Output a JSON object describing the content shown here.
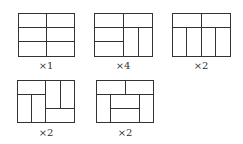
{
  "figures": [
    {
      "id": "tiling-1",
      "multiplier_label": "×1"
    },
    {
      "id": "tiling-2",
      "multiplier_label": "×4"
    },
    {
      "id": "tiling-3",
      "multiplier_label": "×2"
    },
    {
      "id": "tiling-4",
      "multiplier_label": "×2"
    },
    {
      "id": "tiling-5",
      "multiplier_label": "×2"
    }
  ],
  "colors": {
    "line": "#333333",
    "background": "#ffffff"
  }
}
